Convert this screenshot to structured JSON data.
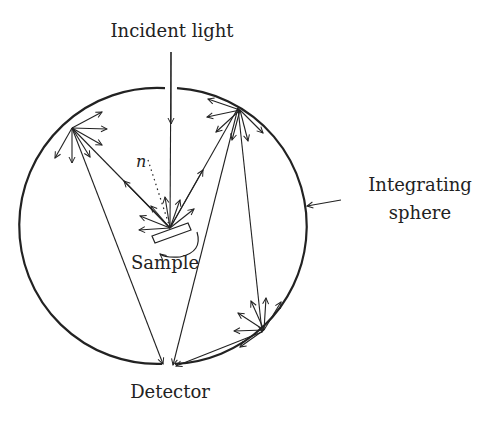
{
  "labels": {
    "incident": "Incident light",
    "sphere_line1": "Integrating",
    "sphere_line2": "sphere",
    "sample": "Sample",
    "detector": "Detector",
    "normal": "n"
  },
  "colors": {
    "stroke": "#222222",
    "background": "#ffffff"
  },
  "geometry": {
    "sphere": {
      "cx": 169,
      "cy": 226,
      "r": 138
    },
    "sample_point": [
      170,
      228
    ],
    "detector_point": [
      168,
      364
    ],
    "reflection_points": [
      [
        72,
        128
      ],
      [
        238,
        108
      ],
      [
        262,
        332
      ]
    ]
  }
}
